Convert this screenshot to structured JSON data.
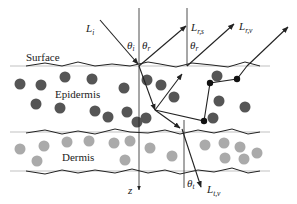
{
  "diagram": {
    "layers": {
      "surface": "Surface",
      "epidermis": "Epidermis",
      "dermis": "Dermis"
    },
    "axis_label": "z",
    "rays": {
      "incident": {
        "main": "L",
        "sub": "i"
      },
      "specular": {
        "main": "L",
        "sub": "r,s"
      },
      "volume_reflect": {
        "main": "L",
        "sub": "r,v"
      },
      "transmit": {
        "main": "L",
        "sub": "t,v"
      }
    },
    "angles": {
      "theta_i": {
        "main": "θ",
        "sub": "i"
      },
      "theta_r1": {
        "main": "θ",
        "sub": "r"
      },
      "theta_r2": {
        "main": "θ",
        "sub": "r"
      },
      "theta_t": {
        "main": "θ",
        "sub": "t"
      }
    },
    "colors": {
      "epidermis_particle": "#555555",
      "dermis_particle": "#aaaaaa",
      "line": "#222222"
    }
  }
}
